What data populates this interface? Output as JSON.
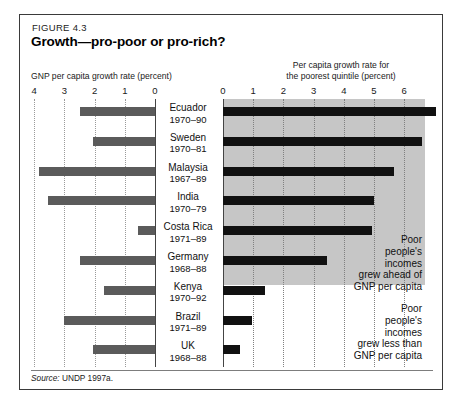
{
  "figure": {
    "number": "FIGURE 4.3",
    "title": "Growth—pro-poor or pro-rich?",
    "left_axis_caption": "GNP per capita growth rate (percent)",
    "right_axis_caption": "Per capita growth rate for\nthe poorest quintile (percent)",
    "source_prefix": "Source:",
    "source_text": " UNDP 1997a.",
    "annotation_above": "Poor people's incomes grew ahead of GNP per capita",
    "annotation_below": "Poor people's incomes grew less than GNP per capita"
  },
  "colors": {
    "left_bar": "#5b5b5b",
    "right_bar": "#111111",
    "shade": "#c6c6c6",
    "frame": "#3a3a3a",
    "grid": "#9a9a9a"
  },
  "chart_data": {
    "type": "bar",
    "title": "Growth—pro-poor or pro-rich?",
    "orientation": "horizontal",
    "panels": [
      {
        "name": "left",
        "xlabel": "GNP per capita growth rate (percent)",
        "ticks": [
          4,
          3,
          2,
          1,
          0
        ],
        "xlim": [
          4,
          0
        ],
        "direction": "reversed",
        "grid": true,
        "values": [
          2.5,
          2.05,
          3.85,
          3.55,
          0.55,
          2.5,
          1.7,
          3.0,
          2.05
        ]
      },
      {
        "name": "right",
        "xlabel": "Per capita growth rate for the poorest quintile (percent)",
        "ticks": [
          0,
          1,
          2,
          3,
          4,
          5,
          6
        ],
        "xlim": [
          0,
          6.75
        ],
        "direction": "normal",
        "grid": true,
        "values": [
          7.05,
          6.6,
          5.65,
          5.0,
          4.95,
          3.45,
          1.4,
          0.95,
          0.55
        ]
      }
    ],
    "categories": [
      "Ecuador 1970–90",
      "Sweden 1970–81",
      "Malaysia 1967–89",
      "India 1970–79",
      "Costa Rica 1971–89",
      "Germany 1968–88",
      "Kenya 1970–92",
      "Brazil 1971–89",
      "UK 1968–88"
    ],
    "annotations": [
      {
        "text": "Poor people's incomes grew ahead of GNP per capita",
        "applies_to_rows": [
          0,
          1,
          2,
          3,
          4,
          5
        ],
        "shaded": true
      },
      {
        "text": "Poor people's incomes grew less than GNP per capita",
        "applies_to_rows": [
          6,
          7,
          8
        ],
        "shaded": false
      }
    ]
  },
  "left_ticks": [
    {
      "label": "4"
    },
    {
      "label": "3"
    },
    {
      "label": "2"
    },
    {
      "label": "1"
    },
    {
      "label": "0"
    }
  ],
  "right_ticks": [
    {
      "label": "0"
    },
    {
      "label": "1"
    },
    {
      "label": "2"
    },
    {
      "label": "3"
    },
    {
      "label": "4"
    },
    {
      "label": "5"
    },
    {
      "label": "6"
    }
  ],
  "rows": [
    {
      "country": "Ecuador",
      "years": "1970–90",
      "gnp": 2.5,
      "poorest": 7.05
    },
    {
      "country": "Sweden",
      "years": "1970–81",
      "gnp": 2.05,
      "poorest": 6.6
    },
    {
      "country": "Malaysia",
      "years": "1967–89",
      "gnp": 3.85,
      "poorest": 5.65
    },
    {
      "country": "India",
      "years": "1970–79",
      "gnp": 3.55,
      "poorest": 5.0
    },
    {
      "country": "Costa Rica",
      "years": "1971–89",
      "gnp": 0.55,
      "poorest": 4.95
    },
    {
      "country": "Germany",
      "years": "1968–88",
      "gnp": 2.5,
      "poorest": 3.45
    },
    {
      "country": "Kenya",
      "years": "1970–92",
      "gnp": 1.7,
      "poorest": 1.4
    },
    {
      "country": "Brazil",
      "years": "1971–89",
      "gnp": 3.0,
      "poorest": 0.95
    },
    {
      "country": "UK",
      "years": "1968–88",
      "gnp": 2.05,
      "poorest": 0.55
    }
  ]
}
